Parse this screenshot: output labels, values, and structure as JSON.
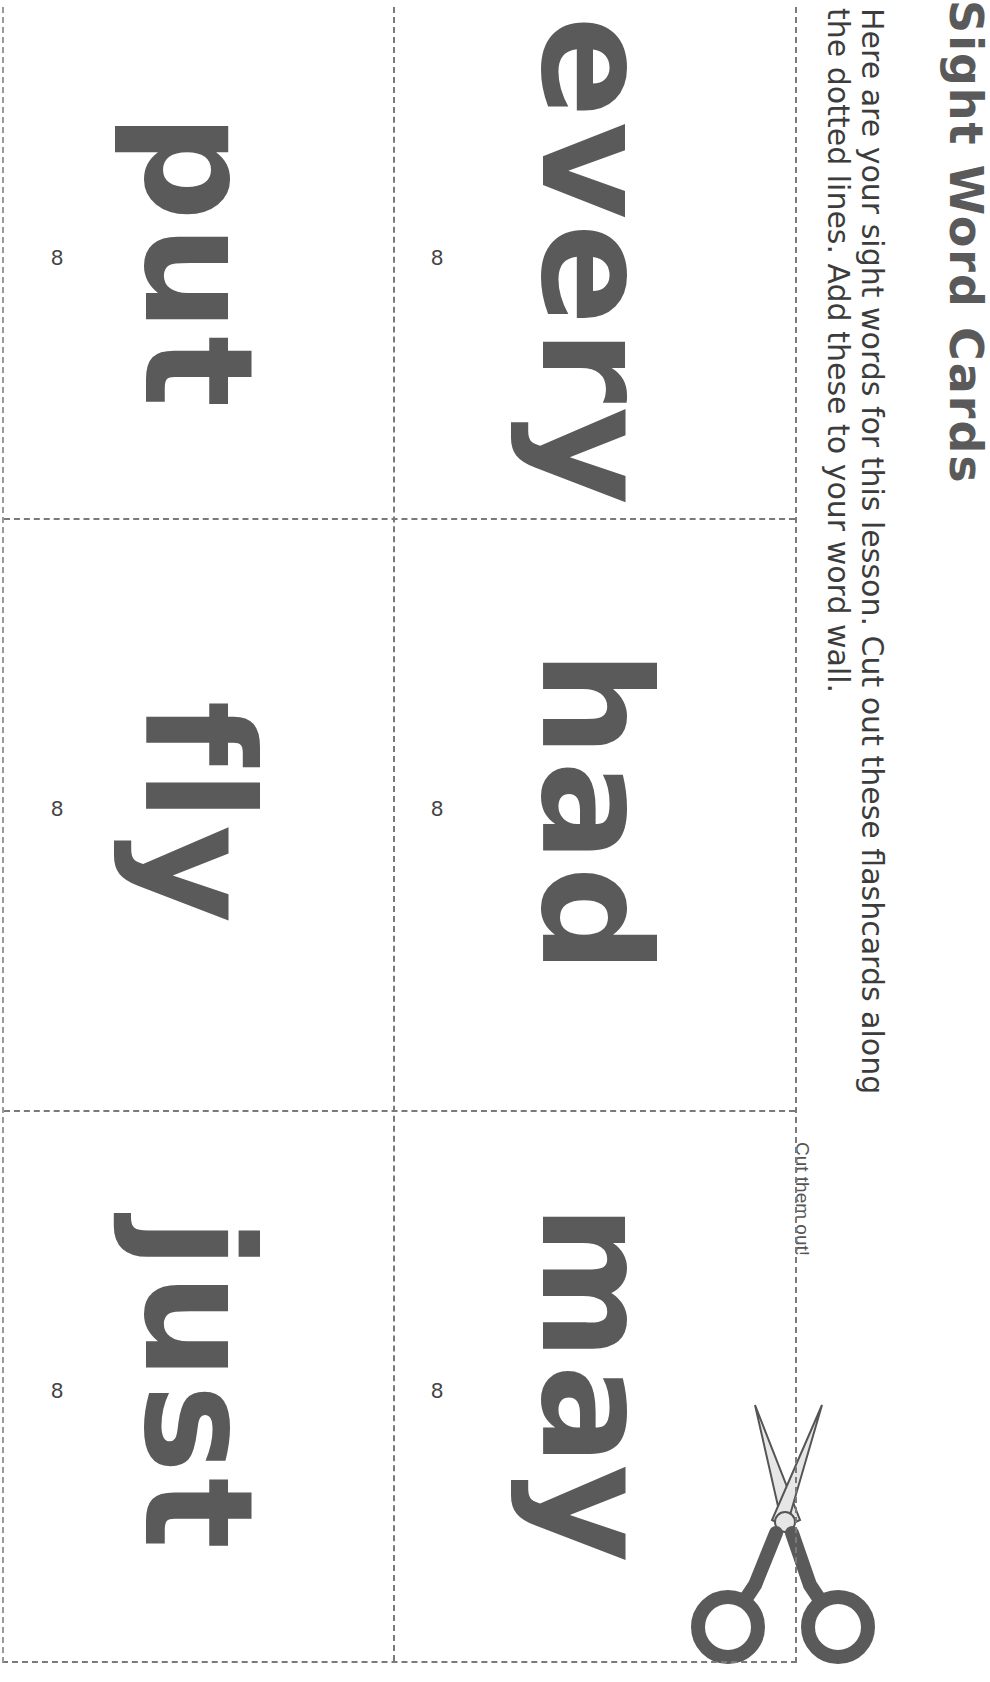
{
  "document": {
    "title": "Sight Word Cards",
    "instructions": [
      "Here are your sight words for this lesson. Cut out these flashcards along",
      "the dotted lines. Add these to your word wall."
    ],
    "cut_label": "Cut them out!",
    "scissors_icon": "scissors-icon",
    "colors": {
      "word": "#5a5a5a",
      "dashed_line": "#7a7a7a",
      "text": "#3c3c3c"
    }
  },
  "cards": [
    {
      "word": "every",
      "number": "8"
    },
    {
      "word": "had",
      "number": "8"
    },
    {
      "word": "may",
      "number": "8"
    },
    {
      "word": "put",
      "number": "8"
    },
    {
      "word": "fly",
      "number": "8"
    },
    {
      "word": "just",
      "number": "8"
    }
  ]
}
